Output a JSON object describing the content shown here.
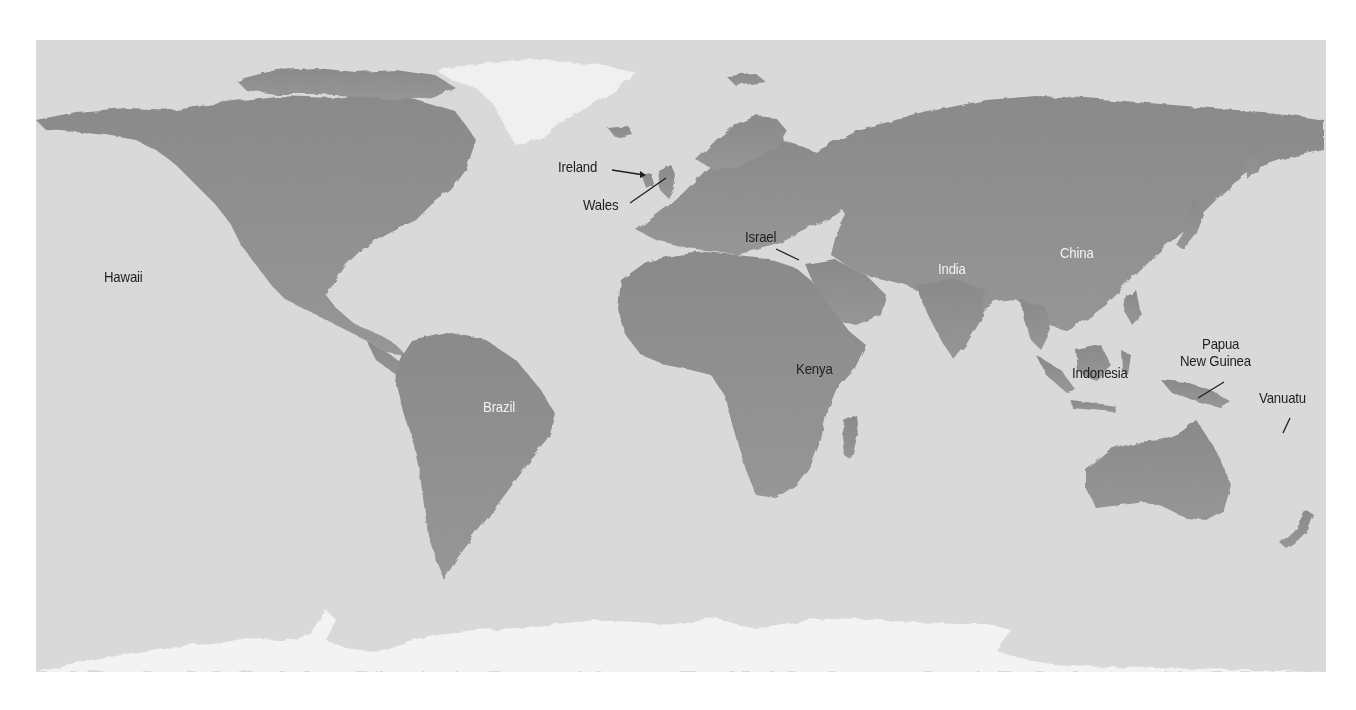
{
  "map": {
    "type": "world relief map (grayscale)",
    "colors": {
      "ocean": "#d9d9d9",
      "land": "#8f8f8f",
      "land_dark": "#777777",
      "ice": "#f4f4f4",
      "label_dark": "#1e1e1e",
      "label_light": "#f2f2f2"
    },
    "labels": [
      {
        "id": "hawaii",
        "text": "Hawaii",
        "x": 104,
        "y": 268,
        "tone": "dark"
      },
      {
        "id": "ireland",
        "text": "Ireland",
        "x": 558,
        "y": 158,
        "tone": "dark"
      },
      {
        "id": "wales",
        "text": "Wales",
        "x": 583,
        "y": 196,
        "tone": "dark"
      },
      {
        "id": "israel",
        "text": "Israel",
        "x": 745,
        "y": 228,
        "tone": "dark"
      },
      {
        "id": "india",
        "text": "India",
        "x": 938,
        "y": 260,
        "tone": "light"
      },
      {
        "id": "china",
        "text": "China",
        "x": 1060,
        "y": 244,
        "tone": "light"
      },
      {
        "id": "brazil",
        "text": "Brazil",
        "x": 483,
        "y": 398,
        "tone": "light"
      },
      {
        "id": "kenya",
        "text": "Kenya",
        "x": 796,
        "y": 360,
        "tone": "dark"
      },
      {
        "id": "indonesia",
        "text": "Indonesia",
        "x": 1072,
        "y": 364,
        "tone": "dark"
      },
      {
        "id": "papua",
        "text": "Papua",
        "x": 1202,
        "y": 335,
        "tone": "dark"
      },
      {
        "id": "new-guinea",
        "text": "New Guinea",
        "x": 1180,
        "y": 352,
        "tone": "dark"
      },
      {
        "id": "vanuatu",
        "text": "Vanuatu",
        "x": 1259,
        "y": 389,
        "tone": "dark"
      }
    ],
    "leader_lines": [
      {
        "for": "ireland",
        "x1": 612,
        "y1": 170,
        "x2": 644,
        "y2": 175
      },
      {
        "for": "wales",
        "x1": 630,
        "y1": 203,
        "x2": 666,
        "y2": 178
      },
      {
        "for": "israel",
        "x1": 776,
        "y1": 249,
        "x2": 799,
        "y2": 260
      },
      {
        "for": "papua-new-guinea",
        "x1": 1224,
        "y1": 382,
        "x2": 1198,
        "y2": 398
      },
      {
        "for": "vanuatu",
        "x1": 1290,
        "y1": 418,
        "x2": 1283,
        "y2": 433
      }
    ]
  }
}
